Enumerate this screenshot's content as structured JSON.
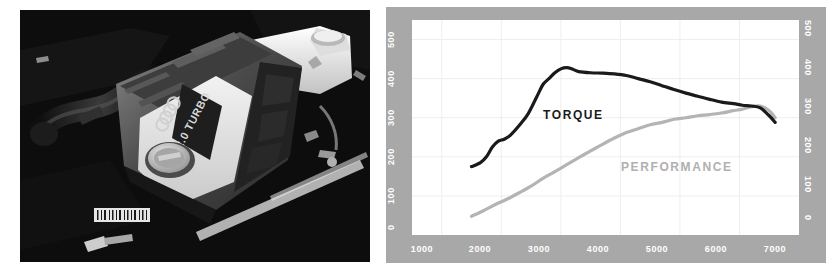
{
  "photo": {
    "name": "engine-bay-photograph",
    "subject": "Audi 2.0 TURBO engine bay, black and white photograph",
    "engine_cover_text": "2.0 TURBO",
    "badge": "four-rings-logo",
    "alt": "Black and white photo of a 2.0 TURBO engine under the hood"
  },
  "chart_data": {
    "type": "line",
    "title": "",
    "xlabel": "",
    "ylabel": "",
    "xlim": [
      500,
      7000
    ],
    "ylim": [
      0,
      550
    ],
    "xticks": [
      1000,
      2000,
      3000,
      4000,
      5000,
      6000,
      7000
    ],
    "yticks": [
      0,
      100,
      200,
      300,
      400,
      500
    ],
    "grid": true,
    "legend": "in-plot-labels",
    "axis_frame_color": "#a8a8a8",
    "plot_background": "#ffffff",
    "series": [
      {
        "name": "TORQUE",
        "color": "#1a1a1a",
        "label_position": "in-plot",
        "x": [
          1500,
          1650,
          1750,
          1850,
          1950,
          2050,
          2150,
          2300,
          2450,
          2600,
          2700,
          2800,
          2900,
          3000,
          3100,
          3200,
          3300,
          3500,
          3700,
          3900,
          4100,
          4300,
          4500,
          4700,
          4900,
          5100,
          5300,
          5500,
          5700,
          5900,
          6050,
          6200,
          6350,
          6500,
          6600
        ],
        "y": [
          175,
          185,
          200,
          225,
          240,
          245,
          255,
          280,
          310,
          355,
          385,
          400,
          415,
          425,
          428,
          424,
          418,
          415,
          414,
          412,
          408,
          400,
          392,
          382,
          372,
          363,
          355,
          347,
          340,
          336,
          332,
          330,
          325,
          305,
          288
        ]
      },
      {
        "name": "PERFORMANCE",
        "color": "#b4b4b4",
        "label_position": "in-plot",
        "x": [
          1500,
          1700,
          1900,
          2100,
          2300,
          2500,
          2700,
          2900,
          3100,
          3300,
          3500,
          3700,
          3900,
          4100,
          4300,
          4500,
          4700,
          4900,
          5100,
          5300,
          5500,
          5700,
          5900,
          6050,
          6200,
          6350,
          6500,
          6600
        ],
        "y": [
          48,
          62,
          78,
          92,
          108,
          125,
          145,
          162,
          180,
          198,
          215,
          232,
          248,
          262,
          272,
          282,
          288,
          296,
          300,
          305,
          308,
          312,
          318,
          322,
          328,
          330,
          318,
          300
        ]
      }
    ]
  }
}
